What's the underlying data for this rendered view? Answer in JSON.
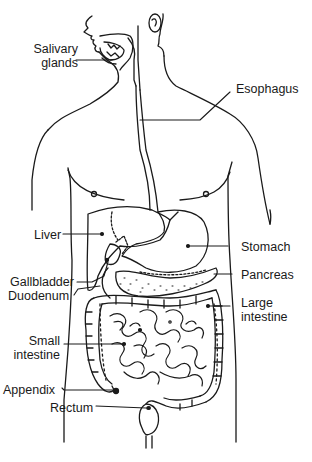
{
  "diagram": {
    "style": "black-and-white line drawing",
    "colors": {
      "ink": "#1a1a1a",
      "background": "#ffffff"
    },
    "labels": [
      {
        "id": "salivary-glands",
        "line1": "Salivary",
        "line2": "glands",
        "side": "left"
      },
      {
        "id": "esophagus",
        "text": "Esophagus",
        "side": "right"
      },
      {
        "id": "liver",
        "text": "Liver",
        "side": "left"
      },
      {
        "id": "stomach",
        "text": "Stomach",
        "side": "right"
      },
      {
        "id": "gallbladder",
        "text": "Gallbladder",
        "side": "left"
      },
      {
        "id": "pancreas",
        "text": "Pancreas",
        "side": "right"
      },
      {
        "id": "duodenum",
        "text": "Duodenum",
        "side": "left"
      },
      {
        "id": "large-intestine",
        "line1": "Large",
        "line2": "intestine",
        "side": "right"
      },
      {
        "id": "small-intestine",
        "line1": "Small",
        "line2": "intestine",
        "side": "left"
      },
      {
        "id": "appendix",
        "text": "Appendix",
        "side": "left"
      },
      {
        "id": "rectum",
        "text": "Rectum",
        "side": "left"
      }
    ]
  }
}
